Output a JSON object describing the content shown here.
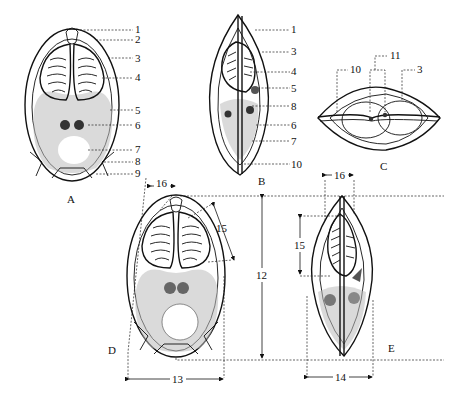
{
  "panels": {
    "A": {
      "letter": "A",
      "callouts": [
        "1",
        "2",
        "3",
        "4",
        "5",
        "6",
        "7",
        "8",
        "9"
      ]
    },
    "B": {
      "letter": "B",
      "callouts": [
        "1",
        "3",
        "4",
        "5",
        "8",
        "6",
        "7",
        "10"
      ]
    },
    "C": {
      "letter": "C",
      "callouts": [
        "10",
        "11",
        "3"
      ]
    },
    "D": {
      "letter": "D",
      "dimensions": [
        "16",
        "15",
        "12",
        "13"
      ]
    },
    "E": {
      "letter": "E",
      "dimensions": [
        "16",
        "15",
        "14"
      ]
    }
  }
}
